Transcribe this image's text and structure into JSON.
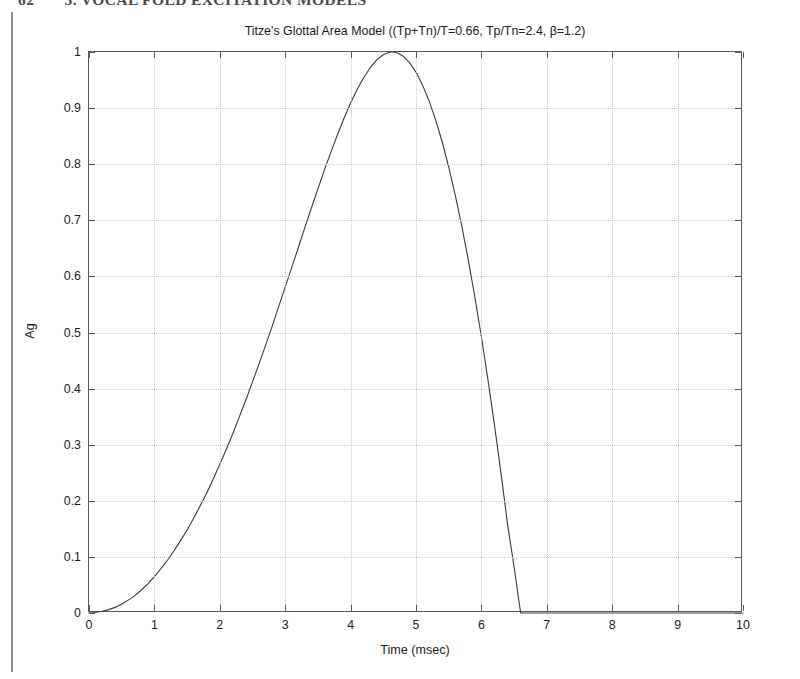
{
  "page": {
    "folio": "62",
    "running_head": "3. VOCAL FOLD EXCITATION MODELS"
  },
  "figure": {
    "title": "Titze's Glottal Area Model ((Tp+Tn)/T=0.66, Tp/Tn=2.4, β=1.2)",
    "xaxis_title": "Time (msec)",
    "yaxis_title": "Ag"
  },
  "chart_data": {
    "type": "line",
    "title": "Titze's Glottal Area Model ((Tp+Tn)/T=0.66, Tp/Tn=2.4, β=1.2)",
    "xlabel": "Time (msec)",
    "ylabel": "Ag",
    "xlim": [
      0,
      10
    ],
    "ylim": [
      0,
      1
    ],
    "xticks": [
      0,
      1,
      2,
      3,
      4,
      5,
      6,
      7,
      8,
      9,
      10
    ],
    "xtick_labels": [
      "0",
      "1",
      "2",
      "3",
      "4",
      "5",
      "6",
      "7",
      "8",
      "9",
      "10"
    ],
    "yticks": [
      0,
      0.1,
      0.2,
      0.3,
      0.4,
      0.5,
      0.6,
      0.7,
      0.8,
      0.9,
      1
    ],
    "ytick_labels": [
      "0",
      "0.1",
      "0.2",
      "0.3",
      "0.4",
      "0.5",
      "0.6",
      "0.7",
      "0.8",
      "0.9",
      "1"
    ],
    "grid": true,
    "grid_style": "dotted",
    "legend": null,
    "line_color": "#3a3a3a",
    "line_width": 1.1,
    "annotations": [
      {
        "label": "peak",
        "x": 4.66,
        "y": 1.0
      },
      {
        "label": "closure",
        "x": 6.6,
        "y": 0.0
      }
    ],
    "parameters": {
      "(Tp+Tn)/T": 0.66,
      "Tp/Tn": 2.4,
      "beta": 1.2
    },
    "series": [
      {
        "name": "Ag(t)",
        "x": [
          0.0,
          0.1,
          0.2,
          0.3,
          0.4,
          0.5,
          0.6,
          0.7,
          0.8,
          0.9,
          1.0,
          1.1,
          1.2,
          1.3,
          1.4,
          1.5,
          1.6,
          1.7,
          1.8,
          1.9,
          2.0,
          2.1,
          2.2,
          2.3,
          2.4,
          2.5,
          2.6,
          2.7,
          2.8,
          2.9,
          3.0,
          3.1,
          3.2,
          3.3,
          3.4,
          3.5,
          3.6,
          3.7,
          3.8,
          3.9,
          4.0,
          4.1,
          4.2,
          4.3,
          4.4,
          4.5,
          4.6,
          4.66,
          4.7,
          4.8,
          4.9,
          5.0,
          5.1,
          5.2,
          5.3,
          5.4,
          5.5,
          5.6,
          5.7,
          5.8,
          5.9,
          6.0,
          6.1,
          6.2,
          6.3,
          6.4,
          6.5,
          6.6,
          6.7,
          7.0,
          7.5,
          8.0,
          8.5,
          9.0,
          9.5,
          10.0
        ],
        "y": [
          0.0,
          0.001,
          0.003,
          0.006,
          0.01,
          0.016,
          0.023,
          0.031,
          0.041,
          0.052,
          0.065,
          0.079,
          0.094,
          0.111,
          0.129,
          0.148,
          0.169,
          0.191,
          0.214,
          0.239,
          0.265,
          0.292,
          0.32,
          0.35,
          0.38,
          0.412,
          0.444,
          0.477,
          0.511,
          0.546,
          0.581,
          0.616,
          0.651,
          0.687,
          0.722,
          0.756,
          0.79,
          0.822,
          0.853,
          0.882,
          0.909,
          0.933,
          0.954,
          0.972,
          0.986,
          0.995,
          1.0,
          1.0,
          0.999,
          0.993,
          0.981,
          0.964,
          0.941,
          0.913,
          0.879,
          0.84,
          0.795,
          0.745,
          0.69,
          0.629,
          0.563,
          0.492,
          0.416,
          0.335,
          0.249,
          0.158,
          0.082,
          0.0,
          0.0,
          0.0,
          0.0,
          0.0,
          0.0,
          0.0,
          0.0,
          0.0
        ]
      }
    ]
  }
}
